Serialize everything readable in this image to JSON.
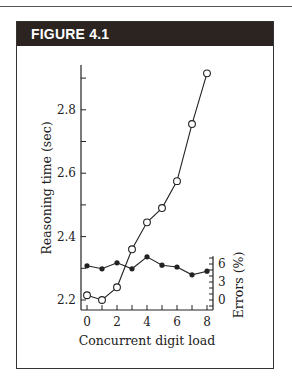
{
  "figure": {
    "title": "FIGURE 4.1"
  },
  "chart_data": {
    "type": "line",
    "title": "FIGURE 4.1",
    "xlabel": "Concurrent digit load",
    "ylabel": "Reasoning time (sec)",
    "y2label": "Errors (%)",
    "x": [
      0,
      1,
      2,
      3,
      4,
      5,
      6,
      7,
      8
    ],
    "x_ticks": [
      "0",
      "2",
      "4",
      "6",
      "8"
    ],
    "y_ticks": [
      "2.2",
      "2.4",
      "2.6",
      "2.8"
    ],
    "y2_ticks": [
      "0",
      "3",
      "6"
    ],
    "ylim": [
      2.17,
      2.95
    ],
    "y2lim": [
      -2,
      7
    ],
    "grid": false,
    "legend": null,
    "series": [
      {
        "name": "Reasoning time (sec)",
        "axis": "left",
        "marker": "open-circle",
        "values": [
          2.215,
          2.2,
          2.24,
          2.36,
          2.445,
          2.49,
          2.575,
          2.755,
          2.915
        ]
      },
      {
        "name": "Errors (%)",
        "axis": "right",
        "marker": "filled-circle",
        "values": [
          5.7,
          5.2,
          6.2,
          5.2,
          7.2,
          5.8,
          5.5,
          4.2,
          4.8
        ]
      }
    ]
  }
}
